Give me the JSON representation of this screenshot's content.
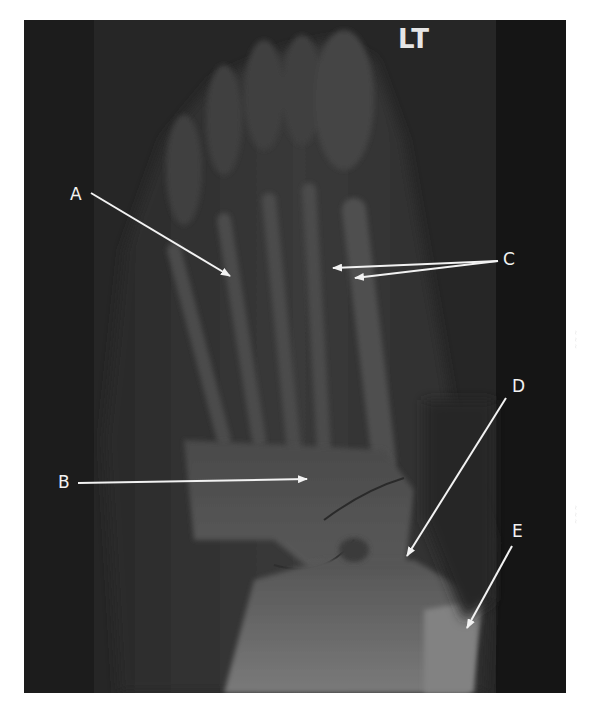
{
  "image": {
    "type": "radiograph",
    "view": "foot, dorsoplantar (AP) projection",
    "side_marker": "LT",
    "background_color": "#ffffff",
    "film_color": "#1b1b1b"
  },
  "annotations": [
    {
      "id": "A",
      "label": "A",
      "label_pos": [
        70,
        186
      ],
      "arrows": [
        {
          "from": [
            91,
            193
          ],
          "to": [
            230,
            276
          ]
        }
      ]
    },
    {
      "id": "B",
      "label": "B",
      "label_pos": [
        58,
        474
      ],
      "arrows": [
        {
          "from": [
            78,
            483
          ],
          "to": [
            307,
            479
          ]
        }
      ]
    },
    {
      "id": "C",
      "label": "C",
      "label_pos": [
        502,
        250
      ],
      "arrows": [
        {
          "from": [
            498,
            261
          ],
          "to": [
            333,
            268
          ]
        },
        {
          "from": [
            498,
            261
          ],
          "to": [
            355,
            278
          ]
        }
      ]
    },
    {
      "id": "D",
      "label": "D",
      "label_pos": [
        512,
        377
      ],
      "arrows": [
        {
          "from": [
            506,
            398
          ],
          "to": [
            407,
            556
          ]
        }
      ]
    },
    {
      "id": "E",
      "label": "E",
      "label_pos": [
        512,
        522
      ],
      "arrows": [
        {
          "from": [
            512,
            546
          ],
          "to": [
            467,
            628
          ]
        }
      ]
    }
  ],
  "annotation_color": "#f2f2f2"
}
